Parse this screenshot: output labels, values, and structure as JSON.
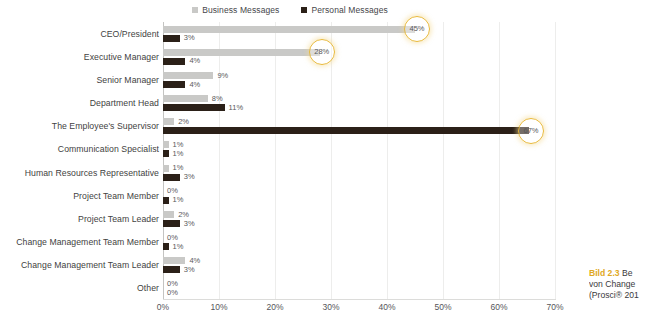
{
  "legend": {
    "entries": [
      {
        "label": "Business Messages",
        "color": "#c9c9c7",
        "icon": "square-marker-icon"
      },
      {
        "label": "Personal Messages",
        "color": "#2b2018",
        "icon": "square-marker-icon"
      }
    ]
  },
  "caption": {
    "tag": "Bild 2.3",
    "line1_rest": " Be",
    "line2": "von Change",
    "line3": "(Prosci® 201",
    "color": "#e0a81e"
  },
  "chart_data": {
    "type": "bar",
    "orientation": "horizontal",
    "title": "",
    "xlabel": "",
    "ylabel": "",
    "xlim": [
      0,
      70
    ],
    "xticks": [
      "0%",
      "10%",
      "20%",
      "30%",
      "40%",
      "50%",
      "60%",
      "70%"
    ],
    "xtick_values": [
      0,
      10,
      20,
      30,
      40,
      50,
      60,
      70
    ],
    "grid": true,
    "legend_position": "top-center",
    "categories": [
      "CEO/President",
      "Executive Manager",
      "Senior Manager",
      "Department Head",
      "The Employee's Supervisor",
      "Communication Specialist",
      "Human Resources Representative",
      "Project Team Member",
      "Project Team Leader",
      "Change Management Team Member",
      "Change Management Team Leader",
      "Other"
    ],
    "series": [
      {
        "name": "Business Messages",
        "color": "#c9c9c7",
        "values": [
          45,
          28,
          9,
          8,
          2,
          1,
          1,
          0,
          2,
          0,
          4,
          0
        ],
        "labels": [
          "45%",
          "28%",
          "9%",
          "8%",
          "2%",
          "1%",
          "1%",
          "0%",
          "2%",
          "0%",
          "4%",
          "0%"
        ],
        "highlighted": [
          true,
          true,
          false,
          false,
          false,
          false,
          false,
          false,
          false,
          false,
          false,
          false
        ]
      },
      {
        "name": "Personal Messages",
        "color": "#2b2018",
        "values": [
          3,
          4,
          4,
          11,
          67,
          1,
          3,
          1,
          3,
          1,
          3,
          0
        ],
        "labels": [
          "3%",
          "4%",
          "4%",
          "11%",
          "67%",
          "1%",
          "3%",
          "1%",
          "3%",
          "1%",
          "3%",
          "0%"
        ],
        "highlighted": [
          false,
          false,
          false,
          false,
          true,
          false,
          false,
          false,
          false,
          false,
          false,
          false
        ]
      }
    ],
    "highlight_color": "#e8b93a"
  }
}
